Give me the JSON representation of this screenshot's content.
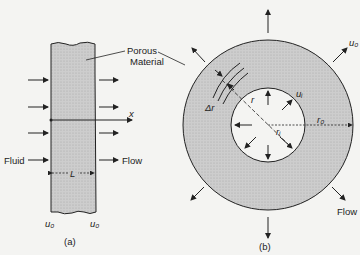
{
  "figure": {
    "panel_a": {
      "caption": "(a)",
      "label_porous": "Porous",
      "label_material": "Material",
      "label_axis": "x",
      "label_fluid": "Fluid",
      "label_flow": "Flow",
      "label_length": "L",
      "label_u_left": "u₀",
      "label_u_right": "u₀"
    },
    "panel_b": {
      "caption": "(b)",
      "label_u_outer": "u₀",
      "label_u_inner": "uᵢ",
      "label_dr": "Δr",
      "label_r": "r",
      "label_ri": "rᵢ",
      "label_ro": "r₀",
      "label_flow": "Flow"
    },
    "colors": {
      "porous_fill": "#c8c8c8",
      "line": "#222222",
      "background": "#f4f4f2"
    }
  }
}
